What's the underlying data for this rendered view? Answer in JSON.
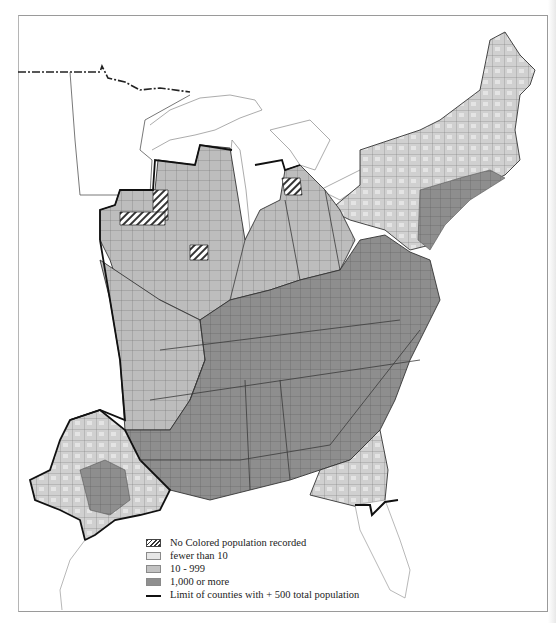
{
  "map": {
    "title": "",
    "colors": {
      "none_recorded_hatch": "#333333",
      "fewer_than_10": "#e6e6e6",
      "10_999": "#c2c2c2",
      "1000_or_more": "#8f8f8f",
      "county_border": "#6f6f6f",
      "state_border": "#3a3a3a",
      "limit_line": "#111111",
      "background": "#ffffff"
    },
    "regions_depicted": [
      "Minnesota",
      "Wisconsin",
      "Michigan",
      "Iowa",
      "Illinois",
      "Indiana",
      "Ohio",
      "Missouri",
      "Kentucky",
      "Tennessee",
      "Arkansas",
      "Louisiana",
      "Texas",
      "Mississippi",
      "Alabama",
      "Georgia",
      "Florida",
      "South Carolina",
      "North Carolina",
      "Virginia",
      "West Virginia",
      "Maryland",
      "Delaware",
      "Pennsylvania",
      "New Jersey",
      "New York",
      "Connecticut",
      "Rhode Island",
      "Massachusetts",
      "Vermont",
      "New Hampshire",
      "Maine"
    ]
  },
  "legend": {
    "items": [
      {
        "key": "hatch",
        "label": "No Colored population recorded"
      },
      {
        "key": "light",
        "label": "fewer than 10"
      },
      {
        "key": "medium",
        "label": "10 - 999"
      },
      {
        "key": "dark",
        "label": "1,000 or more"
      },
      {
        "key": "line",
        "label": "Limit of counties with + 500 total population"
      }
    ]
  }
}
